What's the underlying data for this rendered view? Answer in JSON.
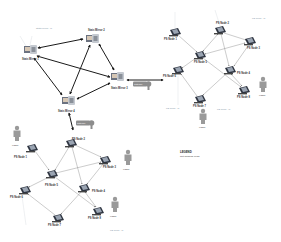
{
  "colors": {
    "thick_arrow": "#1a1a1a",
    "thin_arrow": "#7d7d7d",
    "node_fill": "#2e3440",
    "node_highlight": "#9aa4b2",
    "user_fill": "#9a9a9a",
    "gateway_fill": "#8d8d8d",
    "ghost_label": "#8a9aaa"
  },
  "stats_cluster": {
    "ghost_label": "Stats Mirror ..N",
    "mirrors": [
      {
        "id": "m1",
        "label": "Stats Mirror 1",
        "x": 30,
        "y": 50
      },
      {
        "id": "m2",
        "label": "Stats Mirror 2",
        "x": 93,
        "y": 38
      },
      {
        "id": "m3",
        "label": "Stats Mirror 3",
        "x": 118,
        "y": 75
      },
      {
        "id": "m4",
        "label": "Stats Mirror 4",
        "x": 68,
        "y": 100
      }
    ]
  },
  "gateways": [
    {
      "id": "gw_right",
      "label": "Gateway",
      "x": 138,
      "y": 85
    },
    {
      "id": "gw_bottom",
      "label": "Gateway",
      "x": 80,
      "y": 122
    }
  ],
  "cluster_top_right": {
    "nodes": [
      {
        "label": "PS Node 1",
        "x": 175,
        "y": 32
      },
      {
        "label": "PS Node 2",
        "x": 220,
        "y": 30
      },
      {
        "label": "PS Node 3",
        "x": 250,
        "y": 41
      },
      {
        "label": "PS Node 5",
        "x": 200,
        "y": 55
      },
      {
        "label": "PS Node 4",
        "x": 230,
        "y": 70
      },
      {
        "label": "PS Node 6",
        "x": 178,
        "y": 70
      },
      {
        "label": "PS Node 8",
        "x": 244,
        "y": 90
      },
      {
        "label": "PS Node 7",
        "x": 200,
        "y": 99
      }
    ],
    "ghost_labels": [
      {
        "text": "PS Node ..N",
        "x": 262,
        "y": 18
      },
      {
        "text": "PS Node ..N",
        "x": 172,
        "y": 109
      },
      {
        "text": "PS Node ..N",
        "x": 223,
        "y": 109
      }
    ],
    "users": [
      {
        "label": "USER",
        "x": 262,
        "y": 85
      },
      {
        "label": "USER",
        "x": 203,
        "y": 117
      }
    ]
  },
  "cluster_bottom_left": {
    "nodes": [
      {
        "label": "PS Node 1",
        "x": 32,
        "y": 148
      },
      {
        "label": "PS Node 2",
        "x": 71,
        "y": 143
      },
      {
        "label": "PS Node 3",
        "x": 105,
        "y": 160
      },
      {
        "label": "PS Node 5",
        "x": 52,
        "y": 174
      },
      {
        "label": "PS Node 4",
        "x": 84,
        "y": 188
      },
      {
        "label": "PS Node 6",
        "x": 25,
        "y": 190
      },
      {
        "label": "PS Node 7",
        "x": 58,
        "y": 218
      },
      {
        "label": "PS Node 8",
        "x": 98,
        "y": 211
      }
    ],
    "ghost_labels": [
      {
        "text": "PS Node ..N",
        "x": 118,
        "y": 229
      }
    ],
    "users": [
      {
        "label": "USER",
        "x": 17,
        "y": 135
      },
      {
        "label": "USER",
        "x": 128,
        "y": 160
      },
      {
        "label": "USER",
        "x": 115,
        "y": 206
      }
    ]
  },
  "legend": {
    "title": "LEGEND",
    "items": [
      "Not Sharing Load"
    ]
  }
}
